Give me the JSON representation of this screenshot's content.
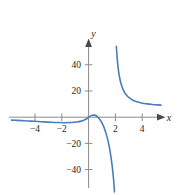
{
  "chart_data": {
    "type": "line",
    "title": "",
    "subtitle": "",
    "xlabel": "x",
    "ylabel": "y",
    "xlim": [
      -5.8,
      6.0
    ],
    "ylim": [
      -50,
      57
    ],
    "grid": false,
    "legend": null,
    "annotations": [],
    "axis": {
      "x_ticks": [
        -4,
        -2,
        2,
        4
      ],
      "x_tick_labels": [
        "−4",
        "−2",
        "2",
        "4"
      ],
      "y_ticks": [
        40,
        20,
        -20,
        -40
      ],
      "y_tick_labels": [
        "40",
        "20",
        "−20",
        "−40"
      ],
      "x_axis_arrow": true,
      "y_axis_arrow": true,
      "origin_label": ""
    },
    "asymptotes": {
      "vertical": 2,
      "horizontal": 9
    },
    "series": [
      {
        "name": "branch-left",
        "color": "#4a7ebb",
        "points": [
          [
            -5.75,
            -2.2
          ],
          [
            -5.3,
            -2.4
          ],
          [
            -4.8,
            -2.7
          ],
          [
            -4.3,
            -3.0
          ],
          [
            -3.8,
            -3.3
          ],
          [
            -3.3,
            -3.6
          ],
          [
            -2.8,
            -3.9
          ],
          [
            -2.3,
            -4.1
          ],
          [
            -1.8,
            -4.2
          ],
          [
            -1.3,
            -4.1
          ],
          [
            -0.9,
            -3.7
          ],
          [
            -0.55,
            -3.0
          ],
          [
            -0.3,
            -2.0
          ],
          [
            -0.12,
            -1.0
          ],
          [
            0.0,
            0.0
          ],
          [
            0.18,
            1.2
          ],
          [
            0.38,
            1.6
          ],
          [
            0.6,
            0.9
          ],
          [
            0.8,
            -1.2
          ],
          [
            1.0,
            -4.4
          ],
          [
            1.2,
            -9.2
          ],
          [
            1.4,
            -16.0
          ],
          [
            1.55,
            -23.0
          ],
          [
            1.68,
            -31.0
          ],
          [
            1.78,
            -39.0
          ],
          [
            1.85,
            -46.0
          ],
          [
            1.9,
            -52.0
          ],
          [
            1.93,
            -57.0
          ]
        ]
      },
      {
        "name": "branch-right",
        "color": "#4a7ebb",
        "points": [
          [
            2.07,
            54.0
          ],
          [
            2.12,
            47.0
          ],
          [
            2.18,
            40.0
          ],
          [
            2.26,
            33.5
          ],
          [
            2.36,
            28.0
          ],
          [
            2.5,
            23.0
          ],
          [
            2.66,
            19.4
          ],
          [
            2.85,
            16.6
          ],
          [
            3.05,
            14.7
          ],
          [
            3.3,
            13.0
          ],
          [
            3.6,
            11.8
          ],
          [
            3.95,
            10.9
          ],
          [
            4.35,
            10.2
          ],
          [
            4.75,
            9.7
          ],
          [
            5.15,
            9.4
          ],
          [
            5.4,
            9.2
          ]
        ]
      }
    ],
    "style": {
      "curve_color": "#4a7ebb",
      "curve_width": 1.6,
      "axis_color": "#8c8c8c",
      "text_color": "#231f20",
      "background": "#ffffff"
    }
  }
}
